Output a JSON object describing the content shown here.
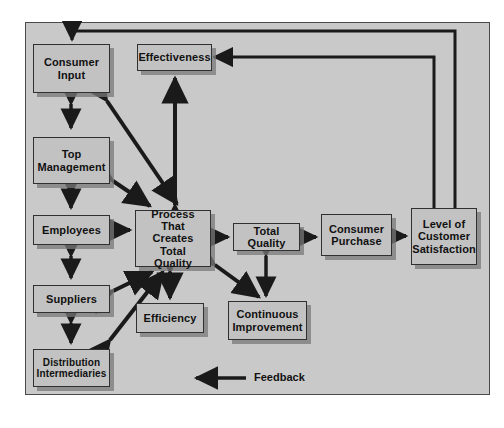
{
  "diagram": {
    "background_color": "#c9c9c9",
    "node_fill": "#c2c2c2",
    "node_border": "#303030",
    "arrow_color": "#1a1a1a",
    "nodes": [
      {
        "id": "consumer-input",
        "label": "Consumer Input",
        "lines": [
          "Consumer",
          "Input"
        ],
        "x": 33,
        "y": 44,
        "w": 77,
        "h": 49,
        "font": 11
      },
      {
        "id": "top-management",
        "label": "Top Management",
        "lines": [
          "Top",
          "Management"
        ],
        "x": 33,
        "y": 137,
        "w": 77,
        "h": 47,
        "font": 11
      },
      {
        "id": "employees",
        "label": "Employees",
        "lines": [
          "Employees"
        ],
        "x": 33,
        "y": 215,
        "w": 77,
        "h": 30,
        "font": 11
      },
      {
        "id": "suppliers",
        "label": "Suppliers",
        "lines": [
          "Suppliers"
        ],
        "x": 33,
        "y": 285,
        "w": 77,
        "h": 28,
        "font": 11
      },
      {
        "id": "distribution-intermediaries",
        "label": "Distribution Intermediaries",
        "lines": [
          "Distribution",
          "Intermediaries"
        ],
        "x": 33,
        "y": 349,
        "w": 77,
        "h": 38,
        "font": 10
      },
      {
        "id": "effectiveness",
        "label": "Effectiveness",
        "lines": [
          "Effectiveness"
        ],
        "x": 137,
        "y": 44,
        "w": 75,
        "h": 27,
        "font": 11
      },
      {
        "id": "process-creates-total-quality",
        "label": "Process That Creates Total Quality",
        "lines": [
          "Process That",
          "Creates Total",
          "Quality"
        ],
        "x": 135,
        "y": 210,
        "w": 76,
        "h": 57,
        "font": 11
      },
      {
        "id": "efficiency",
        "label": "Efficiency",
        "lines": [
          "Efficiency"
        ],
        "x": 136,
        "y": 303,
        "w": 68,
        "h": 30,
        "font": 11
      },
      {
        "id": "continuous-improvement",
        "label": "Continuous Improvement",
        "lines": [
          "Continuous",
          "Improvement"
        ],
        "x": 228,
        "y": 301,
        "w": 79,
        "h": 39,
        "font": 11
      },
      {
        "id": "total-quality",
        "label": "Total Quality",
        "lines": [
          "Total Quality"
        ],
        "x": 233,
        "y": 223,
        "w": 67,
        "h": 28,
        "font": 11
      },
      {
        "id": "consumer-purchase",
        "label": "Consumer Purchase",
        "lines": [
          "Consumer",
          "Purchase"
        ],
        "x": 321,
        "y": 214,
        "w": 71,
        "h": 42,
        "font": 11
      },
      {
        "id": "level-of-customer-satisfaction",
        "label": "Level of Customer Satisfaction",
        "lines": [
          "Level of",
          "Customer",
          "Satisfaction"
        ],
        "x": 411,
        "y": 208,
        "w": 66,
        "h": 57,
        "font": 11
      }
    ],
    "legend": {
      "id": "feedback-legend",
      "label": "Feedback",
      "arrow_x1": 246,
      "arrow_x2": 193,
      "arrow_y": 378,
      "label_x": 254,
      "label_y": 371,
      "font": 11
    }
  }
}
